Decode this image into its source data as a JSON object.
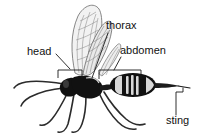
{
  "figure": {
    "background_color": "#ffffff",
    "ink_color": "#111111",
    "width": 199,
    "height": 139
  },
  "labels": {
    "head": "head",
    "thorax": "thorax",
    "abdomen": "abdomen",
    "sting": "sting"
  },
  "annotations": {
    "head_bracket": "bracket spanning the head region",
    "abdomen_bracket": "bracket spanning the abdomen region",
    "head_leader": "line from head label down-right to head bracket",
    "thorax_leader": "line from thorax label down-left to thorax",
    "abdomen_leader": "line from abdomen label down-left to abdomen bracket",
    "sting_leader": "elbow line from sting tip down to sting label"
  }
}
